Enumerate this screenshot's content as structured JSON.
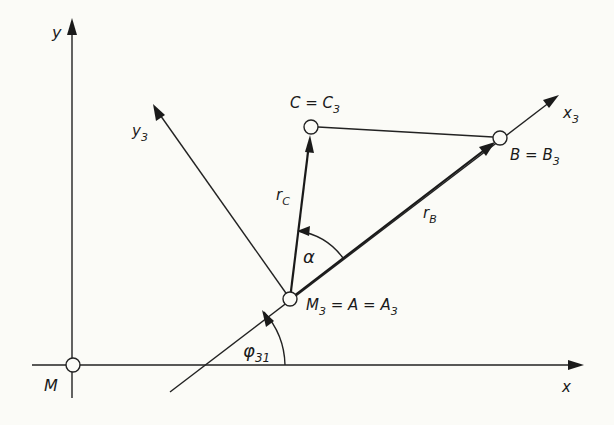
{
  "figure": {
    "background": "#fbfbf7",
    "ink": "#1a1a1a",
    "axes": {
      "x_label": "x",
      "y_label": "y",
      "origin_label": "M"
    },
    "rotated_axes": {
      "x3_label": "x",
      "x3_sub": "3",
      "y3_label": "y",
      "y3_sub": "3"
    },
    "points": {
      "A": {
        "label": "M",
        "sub": "3",
        "rest": " = A = A",
        "rest_sub": "3"
      },
      "B": {
        "label": "B = B",
        "sub": "3"
      },
      "C": {
        "label": "C = C",
        "sub": "3"
      }
    },
    "vectors": {
      "rB": {
        "label": "r",
        "sub": "B"
      },
      "rC": {
        "label": "r",
        "sub": "C"
      }
    },
    "angles": {
      "alpha": {
        "label": "α"
      },
      "phi31": {
        "label": "φ",
        "sub": "31"
      }
    }
  }
}
